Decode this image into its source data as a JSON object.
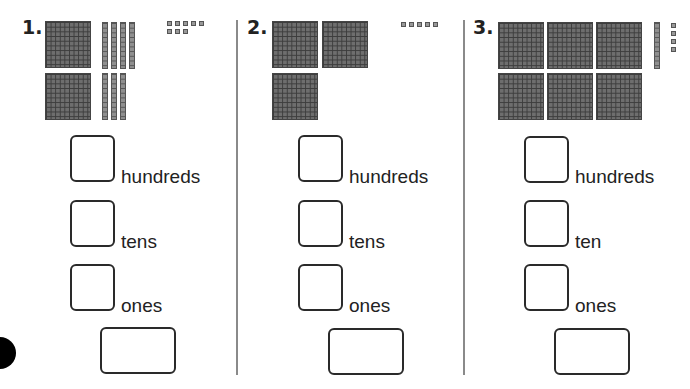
{
  "problems": [
    {
      "number": "1.",
      "blocks": {
        "hundreds": 2,
        "tens": 7,
        "ones": 8
      },
      "labels": {
        "hundreds": "hundreds",
        "tens": "tens",
        "ones": "ones"
      },
      "answers": {
        "hundreds": "",
        "tens": "",
        "ones": "",
        "total": ""
      }
    },
    {
      "number": "2.",
      "blocks": {
        "hundreds": 3,
        "tens": 0,
        "ones": 5
      },
      "labels": {
        "hundreds": "hundreds",
        "tens": "tens",
        "ones": "ones"
      },
      "answers": {
        "hundreds": "",
        "tens": "",
        "ones": "",
        "total": ""
      }
    },
    {
      "number": "3.",
      "blocks": {
        "hundreds": 6,
        "tens": 1,
        "ones": 4
      },
      "labels": {
        "hundreds": "hundreds",
        "tens": "ten",
        "ones": "ones"
      },
      "answers": {
        "hundreds": "",
        "tens": "",
        "ones": "",
        "total": ""
      }
    }
  ],
  "colors": {
    "block_fill": "#6e6e6e",
    "grid_line": "#3c3c3c",
    "box_border": "#2a2a2a",
    "divider": "#8a8a8a"
  }
}
